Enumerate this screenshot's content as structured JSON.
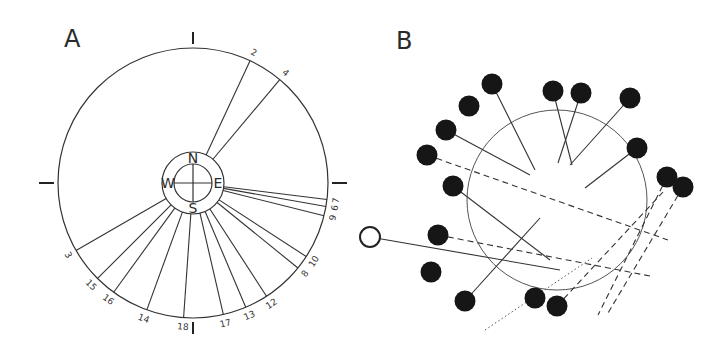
{
  "panels": {
    "a": {
      "label": "A",
      "circle": {
        "cx": 193,
        "cy": 183,
        "r": 135
      },
      "compass": {
        "cx": 193,
        "cy": 183,
        "outer_r": 31,
        "inner_r": 19,
        "N": "N",
        "E": "E",
        "S": "S",
        "W": "W"
      },
      "ticks": [
        "top",
        "bottom",
        "left",
        "right"
      ],
      "rays": [
        {
          "label": "2",
          "angle_deg": 25
        },
        {
          "label": "4",
          "angle_deg": 40
        },
        {
          "label": "7",
          "angle_deg": 97
        },
        {
          "label": "6",
          "angle_deg": 100
        },
        {
          "label": "9",
          "angle_deg": 104
        },
        {
          "label": "10",
          "angle_deg": 123
        },
        {
          "label": "8",
          "angle_deg": 129
        },
        {
          "label": "12",
          "angle_deg": 147
        },
        {
          "label": "13",
          "angle_deg": 157
        },
        {
          "label": "17",
          "angle_deg": 167
        },
        {
          "label": "18",
          "angle_deg": 184
        },
        {
          "label": "14",
          "angle_deg": 200
        },
        {
          "label": "16",
          "angle_deg": 216
        },
        {
          "label": "15",
          "angle_deg": 225
        },
        {
          "label": "3",
          "angle_deg": 240
        }
      ]
    },
    "b": {
      "label": "B",
      "circle": {
        "cx": 557,
        "cy": 200,
        "r": 90
      },
      "open_marker": {
        "cx": 370,
        "cy": 237,
        "r": 10
      },
      "dots": [
        {
          "cx": 492,
          "cy": 84
        },
        {
          "cx": 469,
          "cy": 106
        },
        {
          "cx": 446,
          "cy": 130
        },
        {
          "cx": 427,
          "cy": 155
        },
        {
          "cx": 553,
          "cy": 91
        },
        {
          "cx": 581,
          "cy": 93
        },
        {
          "cx": 630,
          "cy": 98
        },
        {
          "cx": 637,
          "cy": 148
        },
        {
          "cx": 453,
          "cy": 186
        },
        {
          "cx": 438,
          "cy": 235
        },
        {
          "cx": 431,
          "cy": 272
        },
        {
          "cx": 465,
          "cy": 301
        },
        {
          "cx": 535,
          "cy": 298
        },
        {
          "cx": 557,
          "cy": 306
        },
        {
          "cx": 667,
          "cy": 177
        },
        {
          "cx": 683,
          "cy": 187
        }
      ],
      "solid_lines": [
        [
          492,
          84,
          535,
          170
        ],
        [
          446,
          130,
          530,
          175
        ],
        [
          553,
          91,
          572,
          165
        ],
        [
          581,
          93,
          558,
          163
        ],
        [
          630,
          98,
          570,
          165
        ],
        [
          637,
          148,
          585,
          188
        ],
        [
          453,
          186,
          550,
          260
        ],
        [
          370,
          237,
          560,
          270
        ],
        [
          465,
          301,
          540,
          218
        ]
      ],
      "dashed_lines": [
        [
          427,
          155,
          668,
          240
        ],
        [
          438,
          235,
          650,
          276
        ],
        [
          557,
          306,
          663,
          192
        ],
        [
          667,
          177,
          598,
          315
        ],
        [
          683,
          187,
          608,
          313
        ]
      ],
      "dotted_lines": [
        [
          485,
          330,
          592,
          258
        ]
      ]
    }
  }
}
